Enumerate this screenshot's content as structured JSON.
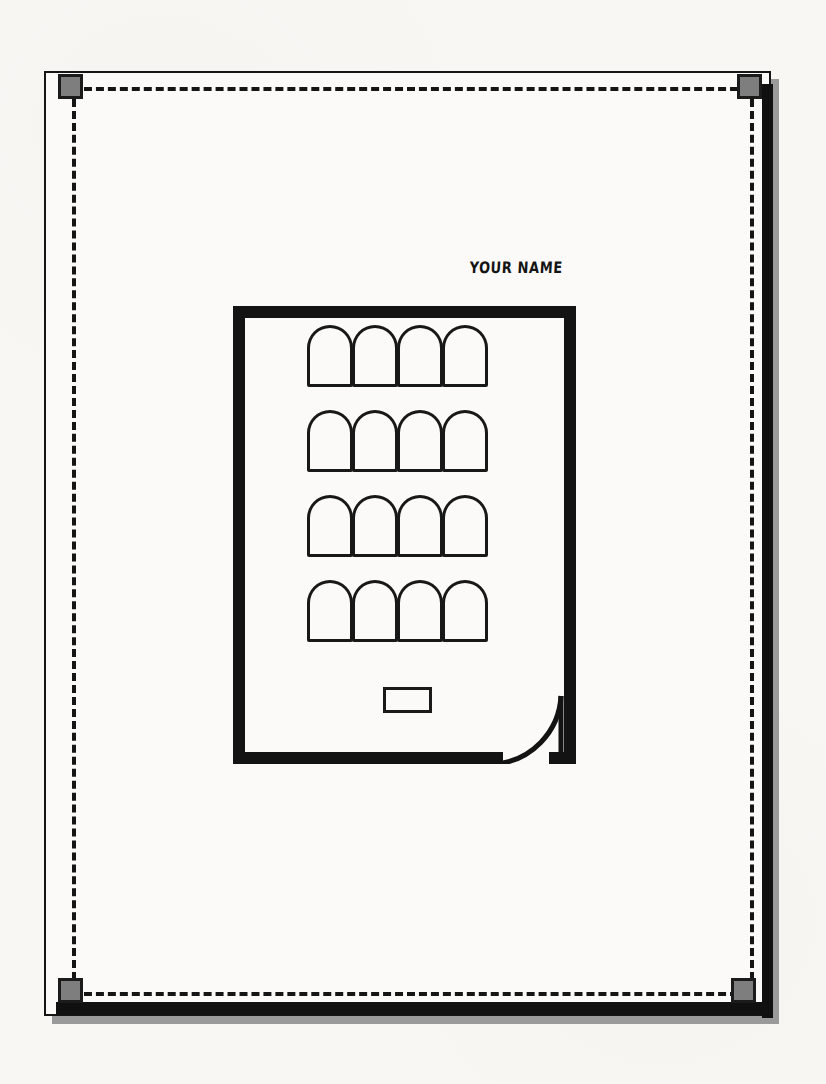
{
  "document": {
    "title": "Classroom Seating Floor Plan Template",
    "type": "floor-plan",
    "orientation": "portrait",
    "page_background": "#f8f7f4",
    "sheet_background": "#fbfaf8",
    "ink_color": "#131313"
  },
  "name_field": {
    "label": "YOUR NAME",
    "style": "handwritten-marker-caps",
    "color": "#141414"
  },
  "margin_guides": {
    "style": "dashed",
    "color": "#151515",
    "dash_width_px": 4,
    "edges": [
      "top",
      "right",
      "bottom",
      "left"
    ]
  },
  "corner_markers": {
    "count": 4,
    "shape": "square",
    "fill": "#7e7e7e",
    "border": "#1b1b1b",
    "size_px": 25,
    "positions": [
      "top-left",
      "top-right",
      "bottom-left",
      "bottom-right"
    ]
  },
  "page_frame": {
    "border_color": "#151515",
    "shadow_color": "#9a9a9a",
    "heavy_edge_color": "#101010",
    "heavy_edges": [
      "right",
      "bottom"
    ]
  },
  "room": {
    "label": "classroom",
    "wall_color": "#131313",
    "wall_thickness_px": 12,
    "width_px": 343,
    "height_px": 458,
    "openings": [
      {
        "name": "doorway",
        "wall": "bottom",
        "swing": "quarter-arc",
        "hinge": "right",
        "opens": "inward"
      }
    ]
  },
  "furniture": {
    "seats": {
      "symbol": "arch",
      "outline_color": "#181818",
      "rows": 4,
      "per_row": 4,
      "total": 16,
      "row_labels": [
        "Row 1",
        "Row 2",
        "Row 3",
        "Row 4"
      ],
      "layout": [
        [
          "seat-1-1",
          "seat-1-2",
          "seat-1-3",
          "seat-1-4"
        ],
        [
          "seat-2-1",
          "seat-2-2",
          "seat-2-3",
          "seat-2-4"
        ],
        [
          "seat-3-1",
          "seat-3-2",
          "seat-3-3",
          "seat-3-4"
        ],
        [
          "seat-4-1",
          "seat-4-2",
          "seat-4-3",
          "seat-4-4"
        ]
      ]
    },
    "podium": {
      "label": "podium",
      "shape": "rectangle",
      "outline_color": "#1a1a1a",
      "width_px": 49,
      "height_px": 26
    }
  }
}
